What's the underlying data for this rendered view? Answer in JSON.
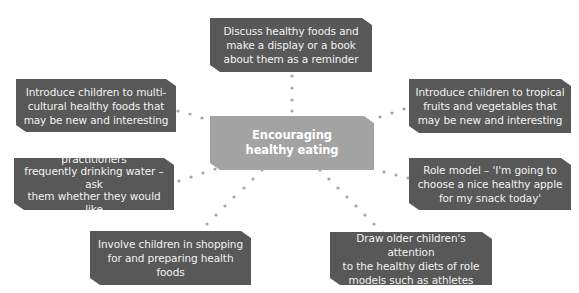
{
  "diagram": {
    "type": "mind-map",
    "center": {
      "id": "center",
      "lines": [
        "Encouraging",
        "healthy eating"
      ]
    },
    "nodes": [
      {
        "id": "top",
        "lines": [
          "Discuss healthy foods and",
          "make a display or a book",
          "about them as a reminder"
        ]
      },
      {
        "id": "left-upper",
        "lines": [
          "Introduce children to multi-",
          "cultural healthy foods that",
          "may be new and interesting"
        ]
      },
      {
        "id": "right-upper",
        "lines": [
          "Introduce children to tropical",
          "fruits and vegetables that",
          "may be new and interesting"
        ]
      },
      {
        "id": "left-lower",
        "lines": [
          "Let children see practitioners",
          "frequently drinking water – ask",
          "them whether they would like",
          "to do the same"
        ]
      },
      {
        "id": "right-lower",
        "lines": [
          "Role model – 'I'm going to",
          "choose a nice healthy apple",
          "for my snack today'"
        ]
      },
      {
        "id": "bottom-left",
        "lines": [
          "Involve children in shopping",
          "for and preparing health foods"
        ]
      },
      {
        "id": "bottom-right",
        "lines": [
          "Draw older children's attention",
          "to the healthy diets of role",
          "models such as athletes"
        ]
      }
    ],
    "colors": {
      "node_fill": "#585858",
      "center_fill": "#a3a3a3",
      "text": "#f2f2f2",
      "connector_dots": "#a6a6a6"
    }
  }
}
